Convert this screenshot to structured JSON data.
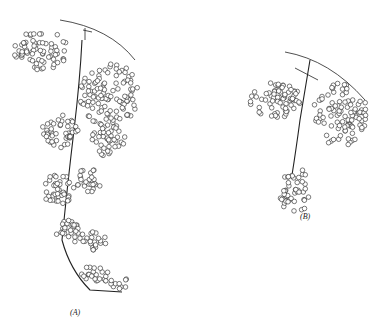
{
  "figure": {
    "panels": [
      {
        "id": "A",
        "label": "(A)",
        "description": "Long elongated pendulous cluster"
      },
      {
        "id": "B",
        "label": "(B)",
        "description": "Shorter compact cluster"
      }
    ]
  },
  "colors": {
    "ink": "#222222",
    "background": "#ffffff"
  }
}
